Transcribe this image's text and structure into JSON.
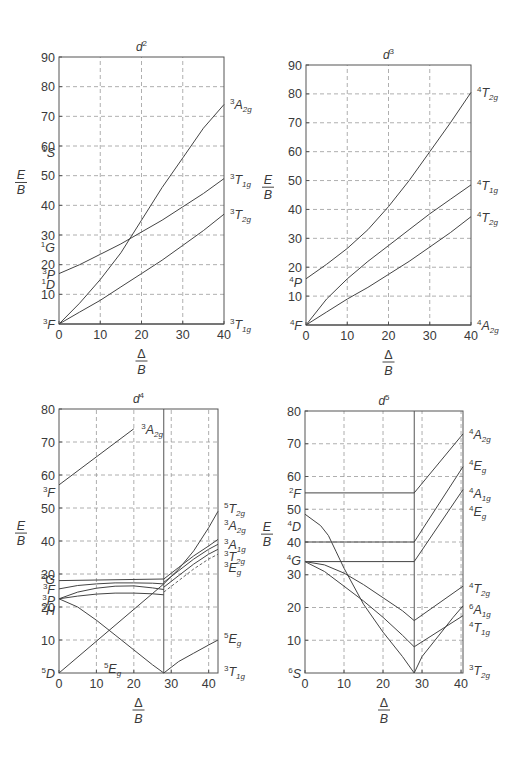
{
  "chart_data": [
    {
      "type": "line",
      "title": "d²",
      "title_base": "d",
      "title_sup": "2",
      "xlabel": "Δ/B",
      "ylabel": "E/B",
      "xlim": [
        0,
        40
      ],
      "ylim": [
        0,
        90
      ],
      "xticks": [
        0,
        10,
        20,
        30,
        40
      ],
      "yticks": [
        10,
        20,
        30,
        40,
        50,
        60,
        70,
        80,
        90
      ],
      "grid": true,
      "box": {
        "x0": 59,
        "x1": 224,
        "y0": 324,
        "y1": 57
      },
      "series": [
        {
          "name": "³A2g",
          "x": [
            0,
            5,
            10,
            15,
            20,
            25,
            30,
            35,
            40
          ],
          "y": [
            0,
            7,
            15,
            24,
            35,
            46,
            56,
            66,
            74
          ]
        },
        {
          "name": "³T1g (upper)",
          "x": [
            0,
            5,
            10,
            15,
            20,
            25,
            30,
            35,
            40
          ],
          "y": [
            17,
            20,
            23.5,
            27,
            31,
            35,
            39.5,
            44,
            49
          ]
        },
        {
          "name": "³T2g",
          "x": [
            0,
            5,
            10,
            15,
            20,
            25,
            30,
            35,
            40
          ],
          "y": [
            0,
            4,
            8,
            12.5,
            17,
            21.5,
            26.5,
            31.5,
            37
          ]
        },
        {
          "name": "³T1g (ground)",
          "x": [
            0,
            40
          ],
          "y": [
            0,
            0
          ]
        }
      ],
      "left_labels": [
        {
          "term": "¹S",
          "sup": "1",
          "base": "S",
          "y": 58
        },
        {
          "term": "¹G",
          "sup": "1",
          "base": "G",
          "y": 26
        },
        {
          "term": "³P",
          "sup": "3",
          "base": "P",
          "y": 17
        },
        {
          "term": "¹D",
          "sup": "1",
          "base": "D",
          "y": 13.5
        },
        {
          "term": "³F",
          "sup": "3",
          "base": "F",
          "y": 0
        }
      ],
      "right_labels": [
        {
          "term": "³A2g",
          "sup": "3",
          "base": "A",
          "sub": "2g",
          "y": 74
        },
        {
          "term": "³T1g",
          "sup": "3",
          "base": "T",
          "sub": "1g",
          "y": 49
        },
        {
          "term": "³T2g",
          "sup": "3",
          "base": "T",
          "sub": "2g",
          "y": 37
        },
        {
          "term": "³T1g",
          "sup": "3",
          "base": "T",
          "sub": "1g",
          "y": 0
        }
      ]
    },
    {
      "type": "line",
      "title": "d³",
      "title_base": "d",
      "title_sup": "3",
      "xlabel": "Δ/B",
      "ylabel": "E/B",
      "xlim": [
        0,
        40
      ],
      "ylim": [
        0,
        90
      ],
      "xticks": [
        0,
        10,
        20,
        30,
        40
      ],
      "yticks": [
        10,
        20,
        30,
        40,
        50,
        60,
        70,
        80,
        90
      ],
      "grid": true,
      "box": {
        "x0": 306,
        "x1": 471,
        "y0": 325,
        "y1": 65
      },
      "series": [
        {
          "name": "⁴T1g (upper, labeled ⁴T2g)",
          "x": [
            0,
            5,
            10,
            15,
            20,
            25,
            30,
            35,
            40
          ],
          "y": [
            16,
            21,
            26.5,
            33,
            41,
            50,
            60,
            70,
            80.5
          ]
        },
        {
          "name": "⁴T1g",
          "x": [
            0,
            5,
            10,
            15,
            20,
            25,
            30,
            35,
            40
          ],
          "y": [
            0,
            9,
            16,
            22,
            27.5,
            33,
            38.5,
            43.5,
            48.5
          ]
        },
        {
          "name": "⁴T2g",
          "x": [
            0,
            5,
            10,
            15,
            20,
            25,
            30,
            35,
            40
          ],
          "y": [
            0,
            4.5,
            9,
            13,
            17.5,
            22,
            27,
            32,
            37.5
          ]
        },
        {
          "name": "⁴A2g",
          "x": [
            0,
            40
          ],
          "y": [
            0,
            0
          ]
        }
      ],
      "left_labels": [
        {
          "term": "⁴P",
          "sup": "4",
          "base": "P",
          "y": 15
        },
        {
          "term": "⁴F",
          "sup": "4",
          "base": "F",
          "y": 0
        }
      ],
      "right_labels": [
        {
          "term": "⁴T2g",
          "sup": "4",
          "base": "T",
          "sub": "2g",
          "y": 80.5
        },
        {
          "term": "⁴T1g",
          "sup": "4",
          "base": "T",
          "sub": "1g",
          "y": 48.5
        },
        {
          "term": "⁴T2g",
          "sup": "4",
          "base": "T",
          "sub": "2g",
          "y": 37.5
        },
        {
          "term": "⁴A2g",
          "sup": "4",
          "base": "A",
          "sub": "2g",
          "y": 0
        }
      ]
    },
    {
      "type": "line",
      "title": "d⁴",
      "title_base": "d",
      "title_sup": "4",
      "xlabel": "Δ/B",
      "ylabel": "E/B",
      "xlim": [
        0,
        42.5
      ],
      "ylim": [
        0,
        80
      ],
      "xticks": [
        0,
        10,
        20,
        30,
        40
      ],
      "yticks": [
        10,
        20,
        30,
        40,
        50,
        60,
        70,
        80
      ],
      "grid": true,
      "divider_x": 28,
      "box": {
        "x0": 59,
        "x1": 218,
        "y0": 673,
        "y1": 409
      },
      "series": [
        {
          "name": "³A2g (from ³F)",
          "x": [
            0,
            20
          ],
          "y": [
            57,
            74
          ]
        },
        {
          "name": "⁵Eg (high-spin)",
          "x": [
            0,
            5,
            10,
            15,
            20,
            25,
            28
          ],
          "y": [
            22.5,
            20,
            16,
            11.5,
            7,
            2.5,
            0
          ]
        },
        {
          "name": "⁵T2g",
          "x": [
            0,
            28,
            32,
            36,
            40,
            42.5
          ],
          "y": [
            0,
            27,
            31.5,
            37,
            44,
            49
          ]
        },
        {
          "name": "³G level",
          "x": [
            0,
            28
          ],
          "y": [
            28,
            28.5
          ]
        },
        {
          "name": "³F curve",
          "x": [
            0,
            5,
            10,
            15,
            20,
            25,
            28
          ],
          "y": [
            25.5,
            26.5,
            27,
            27.3,
            27.3,
            27.2,
            27
          ]
        },
        {
          "name": "³P curve",
          "x": [
            0,
            5,
            10,
            15,
            20,
            25,
            28
          ],
          "y": [
            22.5,
            24.5,
            25.7,
            26.3,
            26.4,
            25.8,
            25.3
          ]
        },
        {
          "name": "³H curve",
          "x": [
            0,
            5,
            10,
            15,
            20,
            25,
            28
          ],
          "y": [
            22.5,
            23.3,
            23.9,
            24.2,
            24.2,
            24.0,
            23.7
          ]
        },
        {
          "name": "³A2g (right)",
          "x": [
            28,
            32,
            36,
            40,
            42.5
          ],
          "y": [
            28.5,
            32,
            35.5,
            38.5,
            40.5
          ]
        },
        {
          "name": "³A1g",
          "x": [
            28,
            32,
            36,
            40,
            42.5
          ],
          "y": [
            27.5,
            31,
            34.5,
            37.5,
            39
          ]
        },
        {
          "name": "³T2g",
          "x": [
            28,
            32,
            36,
            40,
            42.5
          ],
          "y": [
            26,
            29.5,
            33,
            36,
            37.5
          ]
        },
        {
          "name": "³Eg",
          "x": [
            28,
            32,
            36,
            40,
            42.5
          ],
          "y": [
            24.5,
            28,
            31.5,
            34.5,
            36
          ],
          "dashed": true
        },
        {
          "name": "⁵Eg (right)",
          "x": [
            28,
            32,
            36,
            40,
            42.5
          ],
          "y": [
            0,
            3.5,
            6,
            8.5,
            10
          ]
        }
      ],
      "left_labels": [
        {
          "term": "³F",
          "sup": "3",
          "base": "F",
          "y": 55
        },
        {
          "term": "³G",
          "sup": "3",
          "base": "G",
          "y": 28.5
        },
        {
          "term": "³F",
          "sup": "3",
          "base": "F",
          "y": 25.5
        },
        {
          "term": "³P",
          "sup": "3",
          "base": "P",
          "y": 22
        },
        {
          "term": "³H",
          "sup": "3",
          "base": "H",
          "y": 19
        },
        {
          "term": "⁵D",
          "sup": "5",
          "base": "D",
          "y": 0
        }
      ],
      "inner_labels": [
        {
          "term": "³A2g",
          "sup": "3",
          "base": "A",
          "sub": "2g",
          "x": 22,
          "y": 74
        },
        {
          "term": "⁵Eg",
          "sup": "5",
          "base": "E",
          "sub": "g",
          "x": 12,
          "y": 1.5
        }
      ],
      "right_labels": [
        {
          "term": "⁵T2g",
          "sup": "5",
          "base": "T",
          "sub": "2g",
          "y": 50
        },
        {
          "term": "³A2g",
          "sup": "3",
          "base": "A",
          "sub": "2g",
          "y": 45
        },
        {
          "term": "³A1g",
          "sup": "3",
          "base": "A",
          "sub": "1g",
          "y": 39
        },
        {
          "term": "³T2g",
          "sup": "3",
          "base": "T",
          "sub": "2g",
          "y": 35.5
        },
        {
          "term": "³Eg",
          "sup": "3",
          "base": "E",
          "sub": "g",
          "y": 32
        },
        {
          "term": "⁵Eg",
          "sup": "5",
          "base": "E",
          "sub": "g",
          "y": 10.5
        },
        {
          "term": "³T1g",
          "sup": "3",
          "base": "T",
          "sub": "1g",
          "y": 0.5
        }
      ]
    },
    {
      "type": "line",
      "title": "d⁵",
      "title_base": "d",
      "title_sup": "5",
      "xlabel": "Δ/B",
      "ylabel": "E/B",
      "xlim": [
        0,
        40.5
      ],
      "ylim": [
        0,
        80
      ],
      "xticks": [
        0,
        10,
        20,
        30,
        40
      ],
      "yticks": [
        10,
        20,
        30,
        40,
        50,
        60,
        70,
        80
      ],
      "grid": true,
      "divider_x": 28,
      "box": {
        "x0": 305,
        "x1": 463,
        "y0": 673,
        "y1": 411
      },
      "series": [
        {
          "name": "²F level",
          "x": [
            0,
            28
          ],
          "y": [
            55,
            55
          ]
        },
        {
          "name": "⁴D level",
          "x": [
            0,
            28
          ],
          "y": [
            40,
            40
          ]
        },
        {
          "name": "⁴G level",
          "x": [
            0,
            28
          ],
          "y": [
            34,
            34
          ]
        },
        {
          "name": "⁴T2g (left)",
          "x": [
            0,
            5,
            10,
            15,
            20,
            25,
            28
          ],
          "y": [
            34,
            33,
            30.5,
            27,
            23,
            19,
            16
          ]
        },
        {
          "name": "⁴T1g (left)",
          "x": [
            0,
            5,
            10,
            15,
            20,
            25,
            28
          ],
          "y": [
            34,
            31,
            26.5,
            22,
            17,
            11.5,
            8
          ]
        },
        {
          "name": "⁶A1g descending",
          "x": [
            0,
            4,
            6,
            8,
            10,
            15,
            20,
            25,
            28
          ],
          "y": [
            48.5,
            45,
            42,
            37,
            32,
            21,
            12.5,
            5,
            0
          ]
        },
        {
          "name": "⁴A2g",
          "x": [
            28,
            40.5
          ],
          "y": [
            55,
            73
          ]
        },
        {
          "name": "⁴Eg",
          "x": [
            28,
            40.5
          ],
          "y": [
            40,
            63
          ]
        },
        {
          "name": "⁴A1g/⁴Eg",
          "x": [
            28,
            40.5
          ],
          "y": [
            34,
            56
          ]
        },
        {
          "name": "⁴T2g (right)",
          "x": [
            28,
            40.5
          ],
          "y": [
            16,
            26.5
          ]
        },
        {
          "name": "⁴T1g (right)",
          "x": [
            28,
            40.5
          ],
          "y": [
            8,
            17.5
          ]
        },
        {
          "name": "⁶A1g (right)",
          "x": [
            28,
            30,
            34,
            38,
            40.5
          ],
          "y": [
            0,
            5,
            11,
            17,
            20.5
          ]
        }
      ],
      "left_labels": [
        {
          "term": "²F",
          "sup": "2",
          "base": "F",
          "y": 55
        },
        {
          "term": "⁴D",
          "sup": "4",
          "base": "D",
          "y": 45
        },
        {
          "term": "⁴G",
          "sup": "4",
          "base": "G",
          "y": 34.5
        },
        {
          "term": "⁶S",
          "sup": "6",
          "base": "S",
          "y": 0
        }
      ],
      "right_labels": [
        {
          "term": "⁴A2g",
          "sup": "4",
          "base": "A",
          "sub": "2g",
          "y": 73
        },
        {
          "term": "⁴Eg",
          "sup": "4",
          "base": "E",
          "sub": "g",
          "y": 63.5
        },
        {
          "term": "⁴A1g",
          "sup": "4",
          "base": "A",
          "sub": "1g",
          "y": 55
        },
        {
          "term": "⁴Eg",
          "sup": "4",
          "base": "E",
          "sub": "g",
          "y": 49.5
        },
        {
          "term": "⁴T2g",
          "sup": "4",
          "base": "T",
          "sub": "2g",
          "y": 26
        },
        {
          "term": "⁶A1g",
          "sup": "6",
          "base": "A",
          "sub": "1g",
          "y": 19.5
        },
        {
          "term": "⁴T1g",
          "sup": "4",
          "base": "T",
          "sub": "1g",
          "y": 14
        },
        {
          "term": "³T2g",
          "sup": "3",
          "base": "T",
          "sub": "2g",
          "y": 1
        }
      ]
    }
  ],
  "axis_text": {
    "ylabel_num": "E",
    "ylabel_den": "B",
    "xlabel_num": "Δ",
    "xlabel_den": "B"
  }
}
